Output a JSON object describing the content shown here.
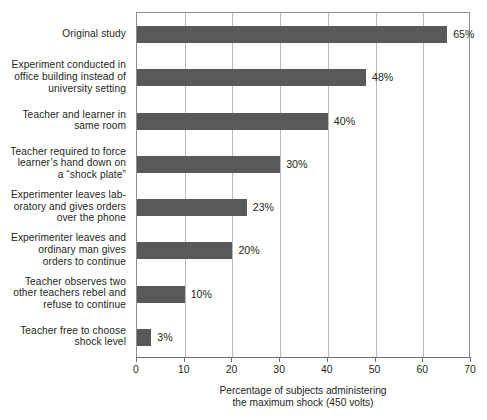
{
  "chart_data": {
    "type": "bar",
    "orientation": "horizontal",
    "title": "",
    "xlabel": "Percentage of subjects administering\nthe maximum shock (450 volts)",
    "ylabel": "",
    "xlim": [
      0,
      70
    ],
    "xticks": [
      0,
      10,
      20,
      30,
      40,
      50,
      60,
      70
    ],
    "xtick_labels": [
      "0",
      "10",
      "20",
      "30",
      "40",
      "50",
      "60",
      "70"
    ],
    "grid": "vertical",
    "legend": "none",
    "bar_color": "#595959",
    "categories": [
      "Original study",
      "Experiment conducted in\noffice building instead of\nuniversity setting",
      "Teacher and learner in\nsame room",
      "Teacher required to force\nlearner’s hand down on\na “shock plate”",
      "Experimenter leaves lab-\noratory and gives orders\nover the phone",
      "Experimenter leaves and\nordinary man gives\norders to continue",
      "Teacher observes two\nother teachers rebel and\nrefuse to continue",
      "Teacher free to choose\nshock level"
    ],
    "values": [
      65,
      48,
      40,
      30,
      23,
      20,
      10,
      3
    ],
    "value_labels": [
      "65%",
      "48%",
      "40%",
      "30%",
      "23%",
      "20%",
      "10%",
      "3%"
    ]
  }
}
